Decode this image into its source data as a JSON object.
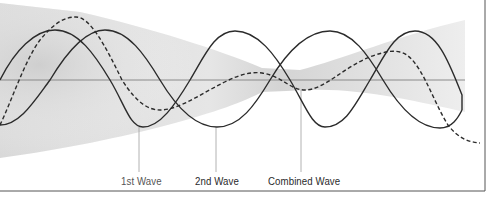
{
  "diagram": {
    "type": "wave-interference",
    "labels": {
      "first_wave": "1st Wave",
      "second_wave": "2nd Wave",
      "combined_wave": "Combined Wave"
    },
    "colors": {
      "wave_stroke": "#2b2b2b",
      "axis": "#8a8a8a",
      "band_dark": "#c8c8c8",
      "band_light": "#f4f4f4",
      "frame": "#555555",
      "leader": "#9a9a9a"
    },
    "waves": [
      {
        "name": "1st Wave",
        "style": "solid",
        "amplitude_px": 48,
        "period_px": 180,
        "phase_peak_x": 55
      },
      {
        "name": "2nd Wave",
        "style": "solid",
        "amplitude_px": 48,
        "period_px": 224,
        "phase_peak_x": 105
      },
      {
        "name": "Combined Wave",
        "style": "dashed"
      }
    ],
    "baseline_y": 80
  }
}
